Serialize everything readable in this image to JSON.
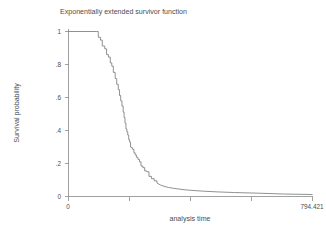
{
  "chart_data": {
    "type": "line",
    "title": "Exponentially extended survivor function",
    "xlabel": "analysis time",
    "ylabel": "Survival probability",
    "xlim": [
      0,
      794.421
    ],
    "ylim": [
      0,
      1
    ],
    "grid": false,
    "legend": "none",
    "xticks": [
      0,
      794.421
    ],
    "xtick_labels": [
      "0",
      "794.421"
    ],
    "xtick_minor": [
      198.605,
      397.211,
      595.816
    ],
    "yticks": [
      0,
      0.2,
      0.4,
      0.6,
      0.8,
      1
    ],
    "ytick_labels": [
      "0",
      ".2",
      ".4",
      ".6",
      ".8",
      "1"
    ],
    "series": [
      {
        "name": "Exponentially extended survivor function",
        "style": "step-then-smooth",
        "color": "#7d7d7d",
        "x": [
          0,
          92,
          97,
          104,
          110,
          118,
          124,
          130,
          136,
          141,
          146,
          152,
          157,
          162,
          166,
          170,
          174,
          178,
          181,
          184,
          187,
          190,
          193,
          196,
          199,
          202,
          205,
          209,
          213,
          217,
          221,
          226,
          231,
          236,
          242,
          248,
          255,
          262,
          270,
          279,
          288,
          299,
          311,
          325,
          341,
          360,
          382,
          409,
          442,
          484,
          540,
          620,
          700,
          794.421
        ],
        "y": [
          1,
          1,
          0.965,
          0.948,
          0.912,
          0.895,
          0.86,
          0.845,
          0.81,
          0.79,
          0.752,
          0.715,
          0.68,
          0.648,
          0.612,
          0.58,
          0.548,
          0.512,
          0.478,
          0.445,
          0.41,
          0.392,
          0.372,
          0.345,
          0.33,
          0.3,
          0.295,
          0.285,
          0.265,
          0.252,
          0.238,
          0.225,
          0.21,
          0.185,
          0.175,
          0.155,
          0.15,
          0.122,
          0.108,
          0.095,
          0.082,
          0.07,
          0.062,
          0.055,
          0.05,
          0.045,
          0.04,
          0.036,
          0.032,
          0.028,
          0.024,
          0.02,
          0.015,
          0.012
        ]
      }
    ]
  },
  "axes": {
    "y_tick_labels": [
      "1",
      ".8",
      ".6",
      ".4",
      ".2",
      "0"
    ],
    "x_tick_labels": [
      "0",
      "794.421"
    ]
  }
}
